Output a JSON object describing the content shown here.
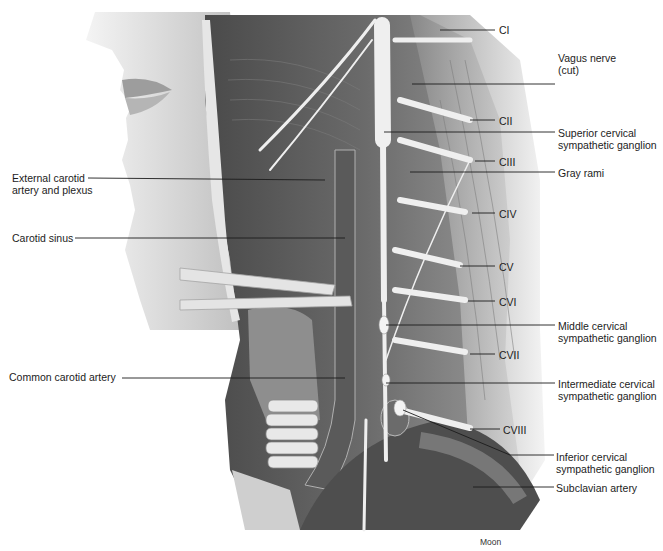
{
  "figure": {
    "credit": "Moon",
    "labels_left": [
      {
        "id": "external-carotid",
        "lines": [
          "External carotid",
          "artery and plexus"
        ],
        "x": 12,
        "y": 172
      },
      {
        "id": "carotid-sinus",
        "lines": [
          "Carotid sinus"
        ],
        "x": 12,
        "y": 232
      },
      {
        "id": "common-carotid",
        "lines": [
          "Common carotid artery"
        ],
        "x": 9,
        "y": 371
      }
    ],
    "labels_right": [
      {
        "id": "c1",
        "lines": [
          "CI"
        ],
        "x": 499,
        "y": 24
      },
      {
        "id": "vagus",
        "lines": [
          "Vagus nerve",
          "(cut)"
        ],
        "x": 558,
        "y": 52
      },
      {
        "id": "c2",
        "lines": [
          "CII"
        ],
        "x": 499,
        "y": 115
      },
      {
        "id": "superior-ganglion",
        "lines": [
          "Superior cervical",
          "sympathetic ganglion"
        ],
        "x": 558,
        "y": 127
      },
      {
        "id": "c3",
        "lines": [
          "CIII"
        ],
        "x": 499,
        "y": 156
      },
      {
        "id": "gray-rami",
        "lines": [
          "Gray rami"
        ],
        "x": 558,
        "y": 167
      },
      {
        "id": "c4",
        "lines": [
          "CIV"
        ],
        "x": 499,
        "y": 208
      },
      {
        "id": "c5",
        "lines": [
          "CV"
        ],
        "x": 499,
        "y": 261
      },
      {
        "id": "c6",
        "lines": [
          "CVI"
        ],
        "x": 499,
        "y": 296
      },
      {
        "id": "middle-ganglion",
        "lines": [
          "Middle cervical",
          "sympathetic ganglion"
        ],
        "x": 558,
        "y": 320
      },
      {
        "id": "c7",
        "lines": [
          "CVII"
        ],
        "x": 499,
        "y": 349
      },
      {
        "id": "intermediate-ganglion",
        "lines": [
          "Intermediate cervical",
          "sympathetic ganglion"
        ],
        "x": 558,
        "y": 378
      },
      {
        "id": "c8",
        "lines": [
          "CVIII"
        ],
        "x": 503,
        "y": 424
      },
      {
        "id": "inferior-ganglion",
        "lines": [
          "Inferior cervical",
          "sympathetic ganglion"
        ],
        "x": 556,
        "y": 451
      },
      {
        "id": "subclavian",
        "lines": [
          "Subclavian artery"
        ],
        "x": 556,
        "y": 482
      }
    ],
    "colors": {
      "ink": "#1c1c1c",
      "muscle": "#5e5e5e",
      "skin": "#d6d6d6",
      "nerve": "#ececec",
      "background": "#ffffff"
    }
  }
}
